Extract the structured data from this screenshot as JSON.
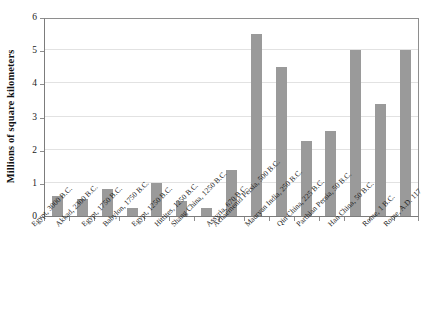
{
  "chart_data": {
    "type": "bar",
    "title": "",
    "subtitle": "",
    "xlabel": "",
    "ylabel": "Millions of square kilometers",
    "ylim": [
      0,
      6
    ],
    "ytick_labels": [
      "0",
      "1",
      "2",
      "3",
      "4",
      "5",
      "6"
    ],
    "ytick_values": [
      0,
      1,
      2,
      3,
      4,
      5,
      6
    ],
    "grid": true,
    "legend": null,
    "legend_position": "none",
    "bar_color": "#9a9a9a",
    "categories": [
      "Egypt, 3000 B.C.",
      "Akkad, 2300 B.C.",
      "Egypt, 1750 B.C.",
      "Babylon, 1750 B.C.",
      "Egypt, 1250 B.C.",
      "Hittites, 1250 B.C.",
      "Shang China, 1250 B.C.",
      "Assyria, 670 B.C.",
      "Achaemenid Persia, 500 B.C.",
      "Mauryan India, 250 B.C.",
      "Qin China, 225 B.C.",
      "Parthian Persia, 50 B.C.",
      "Han China, 50 B.C.",
      "Rome, 1 B.C.",
      "Rome, A.D. 117"
    ],
    "values": [
      0.6,
      0.5,
      0.8,
      0.25,
      1.0,
      0.45,
      0.25,
      1.4,
      5.5,
      4.5,
      2.27,
      2.55,
      5.0,
      3.37,
      5.0
    ]
  }
}
